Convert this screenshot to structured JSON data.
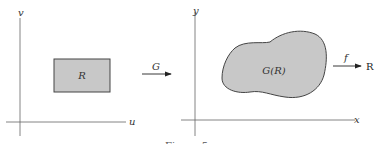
{
  "left_panel": {
    "x_axis_label": "u",
    "y_axis_label": "v",
    "region_label": "R",
    "region_fill": "#c8c8c8"
  },
  "map_G": {
    "label": "G"
  },
  "right_panel": {
    "x_axis_label": "x",
    "y_axis_label": "y",
    "region_label": "G(R)",
    "region_fill": "#c8c8c8"
  },
  "map_f": {
    "label": "f",
    "target": "R"
  },
  "caption": "Figure 5"
}
